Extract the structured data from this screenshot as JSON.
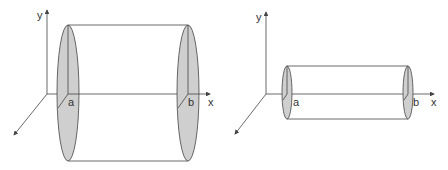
{
  "diagrams": [
    {
      "name": "wide-cylinder",
      "axis_labels": {
        "y": "y",
        "x": "x"
      },
      "endpoint_labels": {
        "a": "a",
        "b": "b"
      }
    },
    {
      "name": "narrow-cylinder",
      "axis_labels": {
        "y": "y",
        "x": "x"
      },
      "endpoint_labels": {
        "a": "a",
        "b": "b"
      }
    }
  ],
  "colors": {
    "disk_fill": "#cfcfcf",
    "line": "#444444",
    "background": "#ffffff"
  }
}
